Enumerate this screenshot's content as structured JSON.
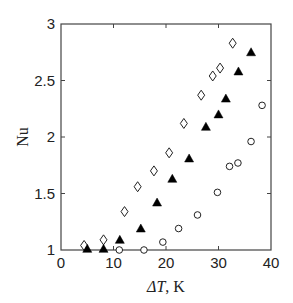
{
  "chart_data": {
    "type": "scatter",
    "title": "",
    "xlabel": "ΔT, K",
    "ylabel": "Nu",
    "xlim": [
      0,
      40
    ],
    "ylim": [
      1,
      3
    ],
    "xticks": [
      0,
      10,
      20,
      30,
      40
    ],
    "yticks": [
      1,
      1.5,
      2,
      2.5,
      3
    ],
    "xtick_labels": [
      "0",
      "10",
      "20",
      "30",
      "40"
    ],
    "ytick_labels": [
      "1",
      "1.5",
      "2",
      "2.5",
      "3"
    ],
    "grid": false,
    "legend": null,
    "series": [
      {
        "name": "diamonds",
        "marker": "diamond-open",
        "x": [
          4.4,
          8.1,
          12.1,
          14.6,
          17.7,
          20.6,
          23.4,
          26.7,
          28.9,
          30.3,
          32.7
        ],
        "y": [
          1.04,
          1.09,
          1.34,
          1.56,
          1.7,
          1.86,
          2.12,
          2.37,
          2.54,
          2.61,
          2.83
        ]
      },
      {
        "name": "triangles",
        "marker": "triangle-filled",
        "x": [
          5.0,
          8.1,
          11.2,
          15.2,
          18.3,
          21.2,
          24.4,
          27.6,
          30.0,
          31.4,
          33.8,
          36.2
        ],
        "y": [
          1.01,
          1.01,
          1.09,
          1.19,
          1.42,
          1.63,
          1.81,
          2.09,
          2.2,
          2.34,
          2.58,
          2.75
        ]
      },
      {
        "name": "circles",
        "marker": "circle-open",
        "x": [
          11.1,
          15.8,
          19.4,
          22.4,
          26.0,
          29.8,
          32.1,
          33.7,
          36.2,
          38.3
        ],
        "y": [
          1.0,
          1.0,
          1.07,
          1.19,
          1.31,
          1.51,
          1.74,
          1.77,
          1.96,
          2.28
        ]
      }
    ]
  },
  "axes": {
    "x_label_main": "ΔT",
    "x_label_unit": ", K",
    "y_label": "Nu"
  }
}
